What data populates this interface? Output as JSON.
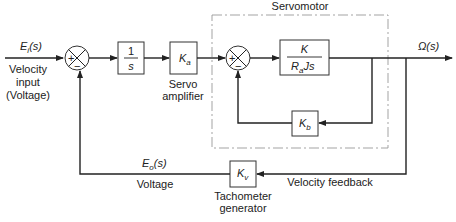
{
  "diagram": {
    "type": "block-diagram",
    "inputs": {
      "signal": "E_i(s)",
      "signal_main": "E",
      "signal_sub": "i",
      "signal_tail": "(s)",
      "label_line1": "Velocity",
      "label_line2": "input",
      "label_line3": "(Voltage)"
    },
    "summing_junction_1": {
      "plus": "+",
      "minus": "−"
    },
    "blocks": {
      "integrator": {
        "numerator": "1",
        "denominator": "s"
      },
      "servo_amplifier": {
        "gain_main": "K",
        "gain_sub": "a",
        "label_line1": "Servo",
        "label_line2": "amplifier"
      },
      "servomotor": {
        "group_label": "Servomotor",
        "summing_junction": {
          "plus": "+",
          "minus": "−"
        },
        "forward": {
          "numerator": "K",
          "denominator_main": "R",
          "denominator_sub": "a",
          "denominator_tail": "Js"
        },
        "feedback": {
          "gain_main": "K",
          "gain_sub": "b"
        }
      },
      "tachometer": {
        "gain_main": "K",
        "gain_sub": "v",
        "label_line1": "Tachometer",
        "label_line2": "generator"
      }
    },
    "output": {
      "signal": "Ω(s)"
    },
    "feedback_path": {
      "signal": "E_o(s)",
      "signal_main": "E",
      "signal_sub": "o",
      "signal_tail": "(s)",
      "signal_label": "Voltage",
      "path_label": "Velocity feedback"
    }
  }
}
